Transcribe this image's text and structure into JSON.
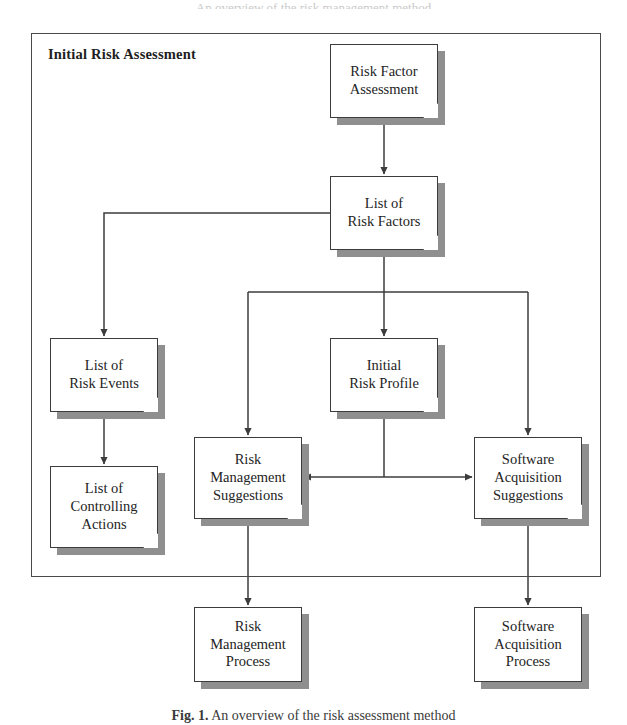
{
  "figure": {
    "top_clipped_text": "An overview of the risk management method",
    "caption_prefix": "Fig. 1.",
    "caption_text": "An overview of the risk assessment method"
  },
  "group": {
    "title": "Initial Risk Assessment",
    "x": 31,
    "y": 33,
    "width": 570,
    "height": 544
  },
  "nodes": [
    {
      "id": "risk-factor-assessment",
      "label": "Risk Factor\nAssessment",
      "x": 330,
      "y": 44,
      "width": 108,
      "height": 74
    },
    {
      "id": "list-of-risk-factors",
      "label": "List of\nRisk Factors",
      "x": 330,
      "y": 176,
      "width": 108,
      "height": 74
    },
    {
      "id": "list-of-risk-events",
      "label": "List of\nRisk Events",
      "x": 50,
      "y": 338,
      "width": 108,
      "height": 74
    },
    {
      "id": "list-of-controlling-actions",
      "label": "List of\nControlling\nActions",
      "x": 50,
      "y": 466,
      "width": 108,
      "height": 82
    },
    {
      "id": "initial-risk-profile",
      "label": "Initial\nRisk Profile",
      "x": 330,
      "y": 338,
      "width": 108,
      "height": 74
    },
    {
      "id": "risk-management-suggestions",
      "label": "Risk\nManagement\nSuggestions",
      "x": 194,
      "y": 437,
      "width": 108,
      "height": 82
    },
    {
      "id": "software-acquisition-suggestions",
      "label": "Software\nAcquisition\nSuggestions",
      "x": 474,
      "y": 437,
      "width": 108,
      "height": 82
    },
    {
      "id": "risk-management-process",
      "label": "Risk\nManagement\nProcess",
      "x": 194,
      "y": 607,
      "width": 108,
      "height": 75
    },
    {
      "id": "software-acquisition-process",
      "label": "Software\nAcquisition\nProcess",
      "x": 474,
      "y": 607,
      "width": 108,
      "height": 75
    }
  ],
  "colors": {
    "line": "#3c3c3c",
    "shadow": "#8f8f8f",
    "face": "#ffffff",
    "text": "#232323"
  },
  "connections": [
    {
      "from": "risk-factor-assessment",
      "to": "list-of-risk-factors",
      "kind": "vertical-arrow"
    },
    {
      "from": "list-of-risk-factors",
      "to": "list-of-risk-events",
      "kind": "left-elbow-arrow"
    },
    {
      "from": "list-of-risk-events",
      "to": "list-of-controlling-actions",
      "kind": "vertical-arrow"
    },
    {
      "from": "list-of-risk-factors",
      "to": "initial-risk-profile",
      "kind": "vertical-arrow"
    },
    {
      "from": "list-of-risk-factors",
      "to": "risk-management-suggestions",
      "kind": "bus-branch-arrow"
    },
    {
      "from": "list-of-risk-factors",
      "to": "software-acquisition-suggestions",
      "kind": "bus-branch-arrow"
    },
    {
      "from": "initial-risk-profile",
      "to": "risk-management-suggestions",
      "kind": "horizontal-arrow-left"
    },
    {
      "from": "initial-risk-profile",
      "to": "software-acquisition-suggestions",
      "kind": "horizontal-arrow-right"
    },
    {
      "from": "risk-management-suggestions",
      "to": "risk-management-process",
      "kind": "vertical-arrow"
    },
    {
      "from": "software-acquisition-suggestions",
      "to": "software-acquisition-process",
      "kind": "vertical-arrow"
    }
  ]
}
